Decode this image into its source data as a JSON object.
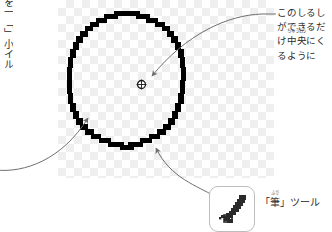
{
  "canvas": {
    "background": "transparency-checkerboard",
    "checker_colors": [
      "#ffffff",
      "#efefef"
    ],
    "checker_size_px": 8
  },
  "drawing": {
    "shape_name": "pixelated-circle",
    "stroke_color": "#000000",
    "description": "hand drawn aliased circle outline"
  },
  "center_mark": {
    "name": "center-registration-mark",
    "color": "#1a1a1a"
  },
  "callouts": {
    "right": {
      "lines": [
        "このしるし",
        "ができるだ",
        "け中央にく",
        "るように"
      ],
      "line3_prefix": "け",
      "line3_ruby_base": "中央",
      "line3_ruby_text": "ちゅうおう",
      "line3_suffix": "にく",
      "color": "#2b2b2b"
    },
    "left_clipped": {
      "text": "を一「」小イル",
      "note": "clipped vertical text at left edge"
    }
  },
  "tool": {
    "icon_name": "paintbrush-tool-icon",
    "label_prefix": "「",
    "label_ruby_base": "筆",
    "label_ruby_text": "ふで",
    "label_suffix": "」ツール",
    "chip_border_color": "#bdbdbd"
  },
  "arrows": {
    "color": "#6e6e6e",
    "items": [
      {
        "name": "arrow-to-center",
        "from": "right caption",
        "to": "center mark"
      },
      {
        "name": "arrow-to-circle-left",
        "from": "left caption",
        "to": "circle left edge"
      },
      {
        "name": "arrow-to-circle-bottom",
        "from": "tool chip",
        "to": "circle bottom edge"
      }
    ]
  }
}
